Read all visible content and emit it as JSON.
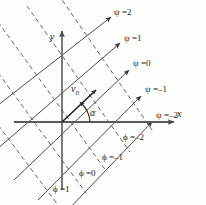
{
  "figure": {
    "background_color": "#fdfdfc",
    "line_color": "#3a3a3a",
    "axis_color": "#555555",
    "axes": {
      "x_label": "x",
      "y_label": "y"
    },
    "vector": {
      "label": "v",
      "subscript": "0"
    },
    "angle": {
      "label": "α"
    },
    "psi_family": {
      "symbol": "ψ",
      "style": "solid-arrow",
      "labels": [
        "ψ =2",
        "ψ =1",
        "ψ =0",
        "ψ =–1",
        "ψ =–2"
      ],
      "values": [
        2,
        1,
        0,
        -1,
        -2
      ],
      "angle_deg": 38
    },
    "phi_family": {
      "symbol": "ϕ",
      "style": "dashed",
      "labels": [
        "ϕ =–2",
        "ϕ =–1",
        "ϕ =0",
        "ϕ =1"
      ],
      "values": [
        -2,
        -1,
        0,
        1
      ],
      "angle_deg": -45
    }
  }
}
